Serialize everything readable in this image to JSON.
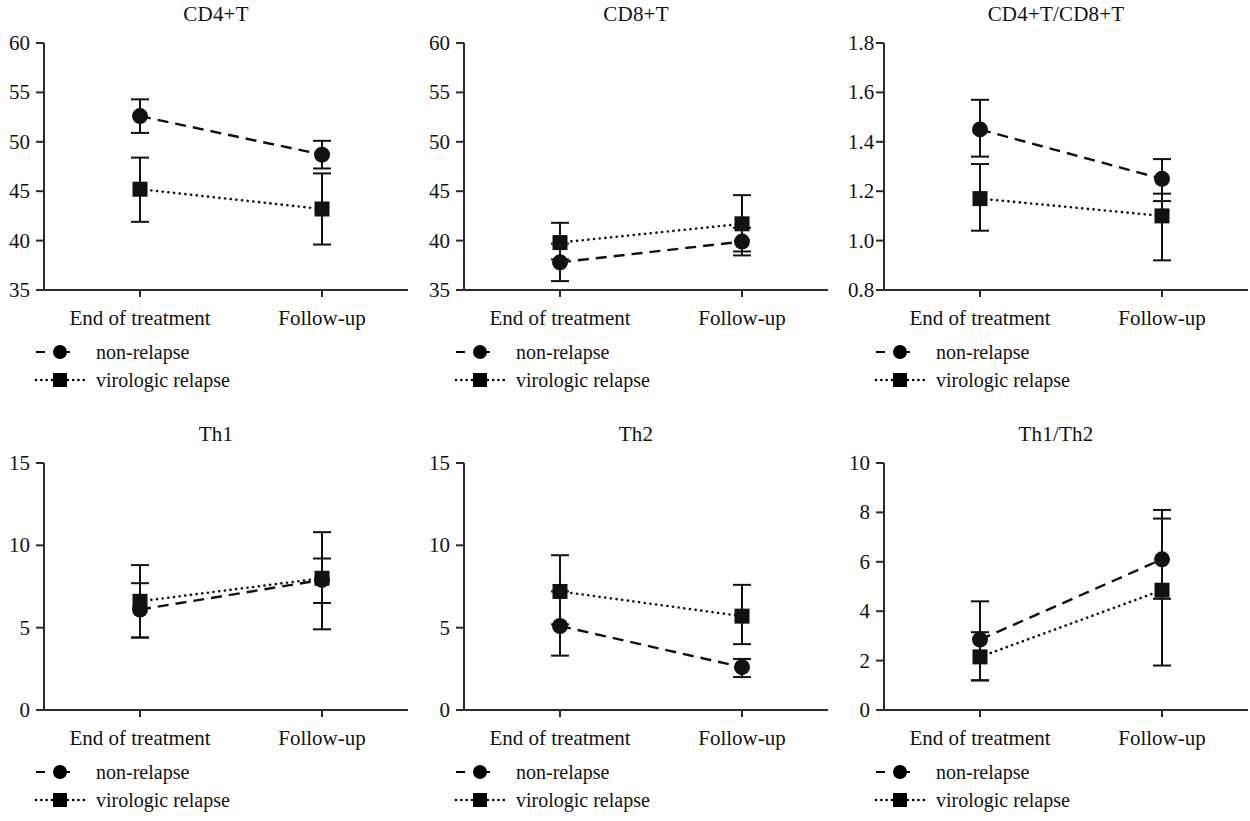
{
  "figure": {
    "columns": 3,
    "rows": 2,
    "legend": {
      "entries": [
        {
          "label": "non-relapse",
          "marker": "circle",
          "line": "dashed",
          "color": "#000000"
        },
        {
          "label": "virologic relapse",
          "marker": "square",
          "line": "dotted",
          "color": "#000000"
        }
      ]
    }
  },
  "chart_data": [
    {
      "type": "line",
      "title": "CD4+T",
      "xlabel": "",
      "ylabel": "",
      "categories": [
        "End of treatment",
        "Follow-up"
      ],
      "ylim": [
        35,
        60
      ],
      "yticks": [
        35,
        40,
        45,
        50,
        55,
        60
      ],
      "ytick_labels": [
        "35",
        "40",
        "45",
        "50",
        "55",
        "60"
      ],
      "grid": false,
      "legend_position": "below-left",
      "series": [
        {
          "name": "non-relapse",
          "values": [
            52.6,
            48.7
          ],
          "err_low": [
            50.9,
            47.3
          ],
          "err_high": [
            54.3,
            50.1
          ]
        },
        {
          "name": "virologic relapse",
          "values": [
            45.2,
            43.2
          ],
          "err_low": [
            41.9,
            39.6
          ],
          "err_high": [
            48.4,
            46.8
          ]
        }
      ]
    },
    {
      "type": "line",
      "title": "CD8+T",
      "xlabel": "",
      "ylabel": "",
      "categories": [
        "End of treatment",
        "Follow-up"
      ],
      "ylim": [
        35,
        60
      ],
      "yticks": [
        35,
        40,
        45,
        50,
        55,
        60
      ],
      "ytick_labels": [
        "35",
        "40",
        "45",
        "50",
        "55",
        "60"
      ],
      "grid": false,
      "legend_position": "below-left",
      "series": [
        {
          "name": "non-relapse",
          "values": [
            37.8,
            39.9
          ],
          "err_low": [
            35.9,
            38.5
          ],
          "err_high": [
            39.7,
            41.3
          ]
        },
        {
          "name": "virologic relapse",
          "values": [
            39.8,
            41.7
          ],
          "err_low": [
            38.1,
            38.9
          ],
          "err_high": [
            41.8,
            44.6
          ]
        }
      ]
    },
    {
      "type": "line",
      "title": "CD4+T/CD8+T",
      "xlabel": "",
      "ylabel": "",
      "categories": [
        "End of treatment",
        "Follow-up"
      ],
      "ylim": [
        0.8,
        1.8
      ],
      "yticks": [
        0.8,
        1.0,
        1.2,
        1.4,
        1.6,
        1.8
      ],
      "ytick_labels": [
        "0.8",
        "1.0",
        "1.2",
        "1.4",
        "1.6",
        "1.8"
      ],
      "grid": false,
      "legend_position": "below-left",
      "series": [
        {
          "name": "non-relapse",
          "values": [
            1.45,
            1.25
          ],
          "err_low": [
            1.34,
            1.16
          ],
          "err_high": [
            1.57,
            1.33
          ]
        },
        {
          "name": "virologic relapse",
          "values": [
            1.17,
            1.1
          ],
          "err_low": [
            1.04,
            0.92
          ],
          "err_high": [
            1.31,
            1.19
          ]
        }
      ]
    },
    {
      "type": "line",
      "title": "Th1",
      "xlabel": "",
      "ylabel": "",
      "categories": [
        "End of treatment",
        "Follow-up"
      ],
      "ylim": [
        0,
        15
      ],
      "yticks": [
        0,
        5,
        10,
        15
      ],
      "ytick_labels": [
        "0",
        "5",
        "10",
        "15"
      ],
      "grid": false,
      "legend_position": "below-left",
      "series": [
        {
          "name": "non-relapse",
          "values": [
            6.1,
            7.9
          ],
          "err_low": [
            4.4,
            4.9
          ],
          "err_high": [
            7.7,
            10.8
          ]
        },
        {
          "name": "virologic relapse",
          "values": [
            6.6,
            8.0
          ],
          "err_low": [
            4.4,
            6.5
          ],
          "err_high": [
            8.8,
            9.2
          ]
        }
      ]
    },
    {
      "type": "line",
      "title": "Th2",
      "xlabel": "",
      "ylabel": "",
      "categories": [
        "End of treatment",
        "Follow-up"
      ],
      "ylim": [
        0,
        15
      ],
      "yticks": [
        0,
        5,
        10,
        15
      ],
      "ytick_labels": [
        "0",
        "5",
        "10",
        "15"
      ],
      "grid": false,
      "legend_position": "below-left",
      "series": [
        {
          "name": "non-relapse",
          "values": [
            5.1,
            2.6
          ],
          "err_low": [
            3.3,
            2.0
          ],
          "err_high": [
            7.2,
            3.1
          ]
        },
        {
          "name": "virologic relapse",
          "values": [
            7.2,
            5.7
          ],
          "err_low": [
            5.2,
            4.0
          ],
          "err_high": [
            9.4,
            7.6
          ]
        }
      ]
    },
    {
      "type": "line",
      "title": "Th1/Th2",
      "xlabel": "",
      "ylabel": "",
      "categories": [
        "End of treatment",
        "Follow-up"
      ],
      "ylim": [
        0,
        10
      ],
      "yticks": [
        0,
        2,
        4,
        6,
        8,
        10
      ],
      "ytick_labels": [
        "0",
        "2",
        "4",
        "6",
        "8",
        "10"
      ],
      "grid": false,
      "legend_position": "below-left",
      "series": [
        {
          "name": "non-relapse",
          "values": [
            2.85,
            6.1
          ],
          "err_low": [
            1.2,
            1.8
          ],
          "err_high": [
            4.4,
            8.1
          ]
        },
        {
          "name": "virologic relapse",
          "values": [
            2.15,
            4.85
          ],
          "err_low": [
            1.2,
            4.5
          ],
          "err_high": [
            3.15,
            7.75
          ]
        }
      ]
    }
  ]
}
